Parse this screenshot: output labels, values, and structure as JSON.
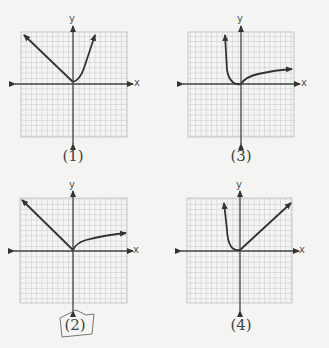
{
  "page": {
    "grid_cells": 20,
    "colors": {
      "background": "#f4f4f2",
      "grid": "#bdbdbd",
      "axis": "#444444",
      "curve": "#333333",
      "label": "#444444"
    }
  },
  "graphs": [
    {
      "id": "1",
      "label": "(1)",
      "x_axis_label": "x",
      "y_axis_label": "y",
      "shape": "left branch straight line rising to upper-left; right branch steep curve rising to upper-right; vertex near origin",
      "circled": false
    },
    {
      "id": "3",
      "label": "(3)",
      "x_axis_label": "x",
      "y_axis_label": "y",
      "shape": "left branch steep curve rising upward; right branch slowly increasing curve (root-like); vertex at origin",
      "circled": false
    },
    {
      "id": "2",
      "label": "(2)",
      "x_axis_label": "x",
      "y_axis_label": "y",
      "shape": "left branch straight line rising to upper-left; right branch slowly increasing curve (root-like); vertex at origin",
      "circled": true
    },
    {
      "id": "4",
      "label": "(4)",
      "x_axis_label": "x",
      "y_axis_label": "y",
      "shape": "left branch steep curve rising upward; right branch straight line rising to upper-right; vertex at origin",
      "circled": false
    }
  ]
}
